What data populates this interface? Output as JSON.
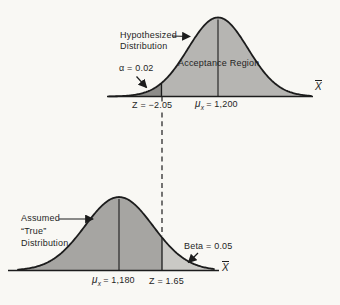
{
  "colors": {
    "background": "#f9f8f4",
    "ink": "#1c1c1c",
    "text": "#1f1f1f",
    "fill_acceptance": "#b6b5b2",
    "fill_alpha_tail": "#8d8c89",
    "fill_true_body": "#a6a5a2",
    "fill_beta_tail": "#cac9c5"
  },
  "top": {
    "title_line1": "Hypothesized",
    "title_line2": "Distribution",
    "region_label": "Acceptance Region",
    "alpha_label": "α = 0.02",
    "z_label": "Z = −2.05",
    "mu_symbol": "μ",
    "mu_sub": "x",
    "mu_rest": "= 1,200",
    "axis_label": "X"
  },
  "bottom": {
    "title_line1": "Assumed",
    "title_line2": "“True”",
    "title_line3": "Distribution",
    "beta_label": "Beta  =  0.05",
    "mu_symbol": "μ",
    "mu_sub": "x",
    "mu_rest": "= 1,180",
    "z_label": "Z = 1.65",
    "axis_label": "X"
  },
  "chart_data": [
    {
      "type": "area",
      "title": "Hypothesized Distribution",
      "distribution": "normal",
      "mean": 1200,
      "mean_label": "μx = 1,200",
      "critical_z": -2.05,
      "alpha": 0.02,
      "alpha_label": "α = 0.02",
      "region_label": "Acceptance Region",
      "xlabel": "X̄",
      "grid": false,
      "shaded_regions": [
        "alpha rejection tail left of Z = −2.05 (dark gray)",
        "acceptance region under curve (gray)"
      ]
    },
    {
      "type": "area",
      "title": "Assumed “True” Distribution",
      "distribution": "normal",
      "mean": 1180,
      "mean_label": "μx = 1,180",
      "critical_z": 1.65,
      "beta": 0.05,
      "beta_label": "Beta = 0.05",
      "xlabel": "X̄",
      "grid": false,
      "shaded_regions": [
        "distribution body left of cutoff (gray)",
        "beta tail right of Z = 1.65 (light gray)"
      ]
    }
  ]
}
